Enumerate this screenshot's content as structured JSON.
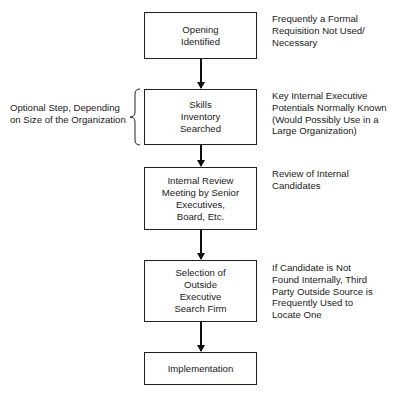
{
  "diagram": {
    "type": "flowchart",
    "steps": [
      {
        "id": "opening",
        "label": "Opening\nIdentified"
      },
      {
        "id": "skills",
        "label": "Skills\nInventory\nSearched"
      },
      {
        "id": "review",
        "label": "Internal Review\nMeeting by Senior\nExecutives,\nBoard, Etc."
      },
      {
        "id": "selection",
        "label": "Selection of\nOutside\nExecutive\nSearch Firm"
      },
      {
        "id": "implementation",
        "label": "Implementation"
      }
    ],
    "notes": [
      "Frequently a Formal\nRequisition Not Used/\nNecessary",
      "Key Internal Executive\nPotentials Normally Known\n(Would Possibly Use in a\nLarge Organization)",
      "Review of Internal\nCandidates",
      "If Candidate is Not\nFound Internally, Third\nParty Outside Source is\nFrequently Used to\nLocate One"
    ],
    "side_note": "Optional Step, Depending\non Size of the Organization",
    "edges": [
      [
        "opening",
        "skills"
      ],
      [
        "skills",
        "review"
      ],
      [
        "review",
        "selection"
      ],
      [
        "selection",
        "implementation"
      ]
    ]
  }
}
